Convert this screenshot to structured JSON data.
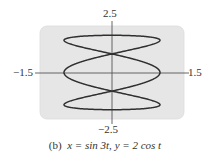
{
  "chart_data": {
    "type": "line",
    "subtype": "parametric",
    "title": "",
    "caption": "(b)  x = sin 3t, y = 2 cos t",
    "caption_parts": {
      "label": "(b)",
      "equation_x": "x = sin 3t,",
      "equation_y": "y = 2 cos t"
    },
    "series": [
      {
        "name": "x = sin 3t, y = 2 cos t",
        "x_expr": "sin(3t)",
        "y_expr": "2cos(t)",
        "t_range": [
          0,
          6.283185307
        ],
        "color": "#2f2f2f"
      }
    ],
    "xlim": [
      -1.5,
      1.5
    ],
    "ylim": [
      -2.5,
      2.5
    ],
    "tick_labels": {
      "x_min": "−1.5",
      "x_max": "1.5",
      "y_min": "−2.5",
      "y_max": "2.5"
    },
    "xlabel": "",
    "ylabel": "",
    "grid": false,
    "legend": "none",
    "background_color": "#e6e6e6",
    "axis_color": "#555555"
  }
}
